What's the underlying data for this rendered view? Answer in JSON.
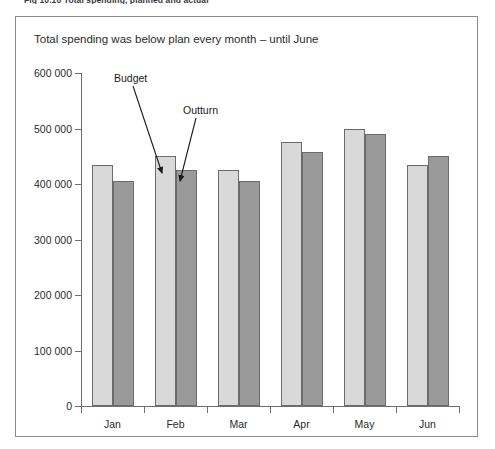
{
  "figure": {
    "caption": "Fig 10.10  Total spending, planned and actual"
  },
  "chart_data": {
    "type": "bar",
    "title": "Total spending was below plan every month – until June",
    "xlabel": "",
    "ylabel": "",
    "categories": [
      "Jan",
      "Feb",
      "Mar",
      "Apr",
      "May",
      "Jun"
    ],
    "series": [
      {
        "name": "Budget",
        "color": "#d9d9d9",
        "values": [
          435000,
          450000,
          425000,
          475000,
          500000,
          435000
        ]
      },
      {
        "name": "Outturn",
        "color": "#9a9a9a",
        "values": [
          405000,
          425000,
          405000,
          458000,
          490000,
          450000
        ]
      }
    ],
    "ylim": [
      0,
      600000
    ],
    "ytick_values": [
      0,
      100000,
      200000,
      300000,
      400000,
      500000,
      600000
    ],
    "ytick_labels": [
      "0",
      "100 000",
      "200 000",
      "300 000",
      "400 000",
      "500 000",
      "600 000"
    ],
    "grid": false,
    "legend": "none",
    "annotations": [
      {
        "text": "Budget",
        "points_to": "Feb budget bar"
      },
      {
        "text": "Outturn",
        "points_to": "Feb outturn bar"
      }
    ]
  },
  "colors": {
    "budget_bar": "#d9d9d9",
    "outturn_bar": "#9a9a9a",
    "bar_outline": "#6b6b6b",
    "axis": "#6e6e6e",
    "frame": "#8b8b8b",
    "text": "#231f20"
  }
}
